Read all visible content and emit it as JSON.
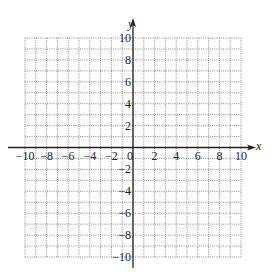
{
  "chart_data": {
    "type": "scatter",
    "title": "",
    "xlabel": "x",
    "ylabel": "y",
    "xlim": [
      -10,
      10
    ],
    "ylim": [
      -10,
      10
    ],
    "grid": true,
    "grid_step": 1,
    "grid_style": "dotted",
    "x_ticks": [
      -10,
      -8,
      -6,
      -4,
      -2,
      0,
      2,
      4,
      6,
      8,
      10
    ],
    "y_ticks": [
      -10,
      -8,
      -6,
      -4,
      -2,
      2,
      4,
      6,
      8,
      10
    ],
    "x_tick_labels": [
      "−10",
      "−8",
      "−6",
      "−4",
      "−2",
      "0",
      "2",
      "4",
      "6",
      "8",
      "10"
    ],
    "y_tick_labels": [
      "−10",
      "−8",
      "−6",
      "−4",
      "−2",
      "2",
      "4",
      "6",
      "8",
      "10"
    ],
    "series": [],
    "legend": null
  },
  "axes": {
    "x_label": "x",
    "y_label": "y",
    "origin_label": "0"
  },
  "colors": {
    "axis": "#222222",
    "grid": "#8a8a8a",
    "text": "#222222",
    "background": "#ffffff"
  }
}
